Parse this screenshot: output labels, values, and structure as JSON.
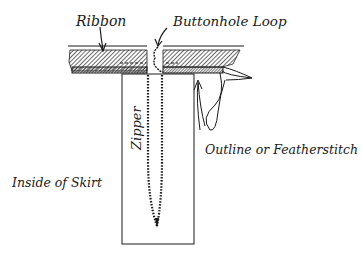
{
  "diagram": {
    "type": "sewing-illustration",
    "labels": {
      "ribbon": "Ribbon",
      "buttonhole_loop": "Buttonhole Loop",
      "zipper": "Zipper",
      "outline_stitch": "Outline or Featherstitch",
      "inside_skirt": "Inside of Skirt"
    },
    "colors": {
      "ink": "#1a1a1a",
      "background": "#ffffff"
    }
  }
}
